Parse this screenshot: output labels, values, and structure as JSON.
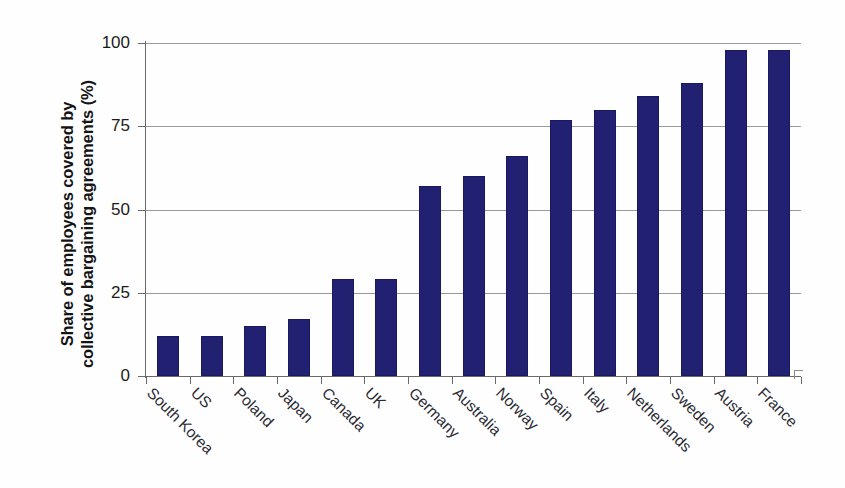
{
  "chart_data": {
    "type": "bar",
    "title": "",
    "xlabel": "",
    "ylabel": "Share of employees covered by collective bargaining agreements (%)",
    "ylabel_line1": "Share of employees covered by",
    "ylabel_line2": "collective bargaining agreements (%)",
    "categories": [
      "South Korea",
      "US",
      "Poland",
      "Japan",
      "Canada",
      "UK",
      "Germany",
      "Australia",
      "Norway",
      "Spain",
      "Italy",
      "Netherlands",
      "Sweden",
      "Austria",
      "France"
    ],
    "values": [
      12,
      12,
      15,
      17,
      29,
      29,
      57,
      60,
      66,
      77,
      80,
      84,
      88,
      98,
      98
    ],
    "ylim": [
      0,
      100
    ],
    "yticks": [
      0,
      25,
      50,
      75,
      100
    ],
    "ytick_labels": [
      "0",
      "25",
      "50",
      "75",
      "100"
    ],
    "grid": true,
    "legend": "none",
    "bar_color": "#222070",
    "grid_color": "#9a9a9a",
    "axis_color": "#6a6a6a",
    "background_color": "#fefeff"
  }
}
